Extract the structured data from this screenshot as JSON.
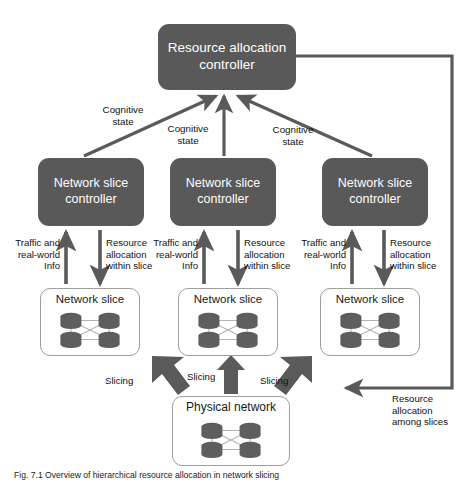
{
  "figure": {
    "title": "Hierarchical resource allocation in network slicing",
    "caption": "Fig. 7.1 Overview of hierarchical resource allocation in network slicing",
    "colors": {
      "controller_fill": "#595959",
      "controller_text": "#ffffff",
      "slice_border": "#9e9e9e",
      "slice_fill": "#ffffff",
      "arrow": "#5a5a5a",
      "node_fill": "#5e5e5e",
      "link": "#b0b0b0",
      "background": "#ffffff"
    }
  },
  "nodes": {
    "resource_allocation_controller": {
      "label_line1": "Resource allocation",
      "label_line2": "controller"
    },
    "network_slice_controllers": [
      {
        "label_line1": "Network slice",
        "label_line2": "controller"
      },
      {
        "label_line1": "Network slice",
        "label_line2": "controller"
      },
      {
        "label_line1": "Network slice",
        "label_line2": "controller"
      }
    ],
    "network_slices": [
      {
        "label": "Network slice"
      },
      {
        "label": "Network slice"
      },
      {
        "label": "Network slice"
      }
    ],
    "physical_network": {
      "label": "Physical network"
    }
  },
  "edge_labels": {
    "cognitive_state": [
      "Cognitive\nstate",
      "Cognitive\nstate",
      "Cognitive\nstate"
    ],
    "traffic_info": [
      "Traffic and\nreal-world\nInfo",
      "Traffic and\nreal-world\nInfo",
      "Traffic and\nreal-world\nInfo"
    ],
    "resource_within_slice": [
      "Resource\nallocation\nwithin slice",
      "Resource\nallocation\nwithin slice",
      "Resource\nallocation\nwithin slice"
    ],
    "slicing": [
      "Slicing",
      "Slicing",
      "Slicing"
    ],
    "resource_among_slices": "Resource\nallocation\namong slices"
  }
}
